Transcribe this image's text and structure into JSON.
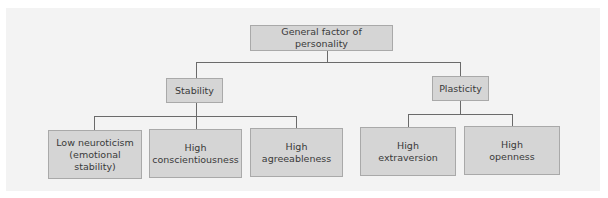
{
  "diagram": {
    "type": "hierarchy",
    "root": {
      "label": "General factor of personality",
      "children": [
        {
          "label": "Stability",
          "children": [
            {
              "label": "Low neuroticism\n(emotional\nstability)"
            },
            {
              "label": "High\nconscientiousness"
            },
            {
              "label": "High\nagreeableness"
            }
          ]
        },
        {
          "label": "Plasticity",
          "children": [
            {
              "label": "High\nextraversion"
            },
            {
              "label": "High\nopenness"
            }
          ]
        }
      ]
    }
  },
  "colors": {
    "background": "#f3f3f3",
    "box_fill": "#d5d5d5",
    "box_border": "#a9a9a9",
    "connector": "#6a6a6a",
    "text": "#3a3a3a"
  }
}
